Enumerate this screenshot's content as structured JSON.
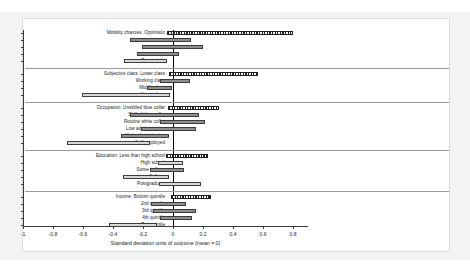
{
  "chart_data": {
    "type": "bar",
    "title": "",
    "xlabel": "Standard deviation units of outcome (mean = 0)",
    "ylabel": "",
    "xlim": [
      -1.0,
      0.9
    ],
    "xticks": [
      -1,
      -0.8,
      -0.6,
      -0.4,
      -0.2,
      0,
      0.2,
      0.4,
      0.6,
      0.8
    ],
    "xticklabels": [
      "-1",
      "-0.8",
      "-0.6",
      "-0.4",
      "-0.2",
      "0",
      "0.2",
      "0.4",
      "0.6",
      "0.8"
    ],
    "grid": false,
    "legend": null,
    "zero_reference_line": 0,
    "orientation": "horizontal",
    "note": "Horizontal confidence-interval bars; hatched bar marks the reference category of each group",
    "colors": {
      "bar_fill_dark": "#8e8e8e",
      "bar_fill_light": "#d8d8d8",
      "bar_hatch": "#1e1e1e",
      "bar_edge": "#3c3c3c",
      "axis": "#3a3a3a",
      "separator": "#9a9a9a",
      "zero_line": "#000000",
      "panel_background": "#ffffff",
      "page_background": "#f3f3f3"
    },
    "groups": [
      {
        "name": "Mobility chances",
        "categories": [
          {
            "label": "Mobility chances: Optimistic",
            "low": -0.04,
            "high": 0.8,
            "style": "hatch"
          },
          {
            "label": "",
            "low": -0.29,
            "high": 0.12,
            "style": "dark"
          },
          {
            "label": "",
            "low": -0.21,
            "high": 0.2,
            "style": "dark"
          },
          {
            "label": "",
            "low": -0.24,
            "high": 0.04,
            "style": "dark"
          },
          {
            "label": "Pessimistic",
            "low": -0.33,
            "high": -0.04,
            "style": "light"
          }
        ]
      },
      {
        "name": "Subjective class",
        "categories": [
          {
            "label": "Subjective class: Lower class",
            "low": -0.03,
            "high": 0.565,
            "style": "hatch"
          },
          {
            "label": "Working class",
            "low": -0.09,
            "high": 0.115,
            "style": "dark"
          },
          {
            "label": "Middle class",
            "low": -0.175,
            "high": -0.005,
            "style": "dark"
          },
          {
            "label": "Upper class",
            "low": -0.605,
            "high": -0.02,
            "style": "light"
          }
        ]
      },
      {
        "name": "Occupation",
        "categories": [
          {
            "label": "Occupation: Unskilled blue collar",
            "low": -0.035,
            "high": 0.305,
            "style": "hatch"
          },
          {
            "label": "Skilled blue collar",
            "low": -0.29,
            "high": 0.175,
            "style": "dark"
          },
          {
            "label": "Routine white collar",
            "low": -0.085,
            "high": 0.215,
            "style": "dark"
          },
          {
            "label": "Low administrative",
            "low": -0.215,
            "high": 0.155,
            "style": "dark"
          },
          {
            "label": "High administrative",
            "low": -0.345,
            "high": -0.03,
            "style": "dark"
          },
          {
            "label": "Self-employed",
            "low": -0.705,
            "high": -0.155,
            "style": "light"
          }
        ]
      },
      {
        "name": "Education",
        "categories": [
          {
            "label": "Education: Less than high school",
            "low": -0.045,
            "high": 0.235,
            "style": "hatch"
          },
          {
            "label": "High school",
            "low": -0.1,
            "high": 0.065,
            "style": "light"
          },
          {
            "label": "Some college",
            "low": -0.155,
            "high": 0.075,
            "style": "dark"
          },
          {
            "label": "College",
            "low": -0.335,
            "high": -0.025,
            "style": "light"
          },
          {
            "label": "Postgraduate",
            "low": -0.095,
            "high": 0.185,
            "style": "light"
          }
        ]
      },
      {
        "name": "Income",
        "categories": [
          {
            "label": "Income: Bottom quintile",
            "low": -0.015,
            "high": 0.255,
            "style": "hatch"
          },
          {
            "label": "2nd quintile",
            "low": -0.145,
            "high": 0.085,
            "style": "dark"
          },
          {
            "label": "3rd quintile",
            "low": -0.135,
            "high": 0.155,
            "style": "dark"
          },
          {
            "label": "4th quintile",
            "low": -0.085,
            "high": 0.125,
            "style": "dark"
          },
          {
            "label": "Top quintile",
            "low": -0.425,
            "high": -0.105,
            "style": "light"
          }
        ]
      }
    ]
  }
}
